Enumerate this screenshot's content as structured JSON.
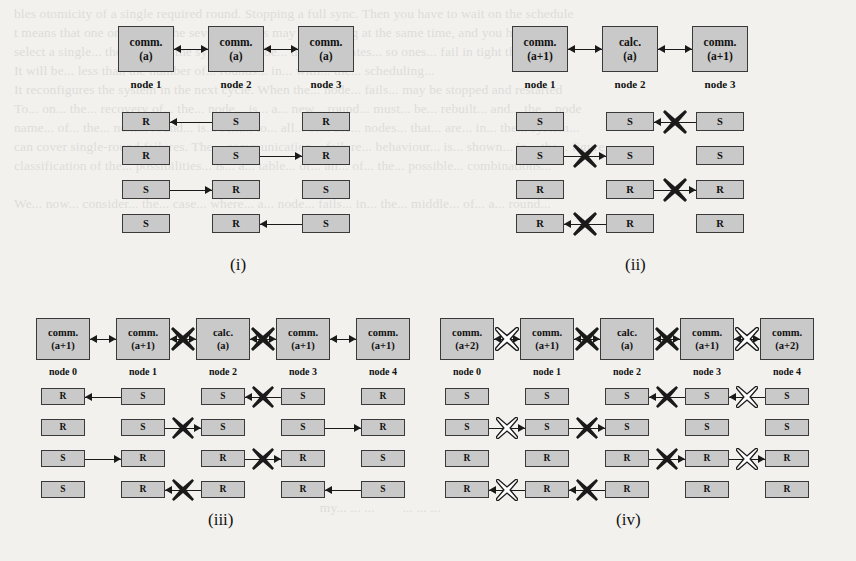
{
  "figure": {
    "background_color": "#f2f1ee",
    "box_fill_color": "#c9c9c9",
    "box_border_color": "#3a3a3a",
    "line_color": "#1a1a1a",
    "blocked_solid_color": "#1a1a1a",
    "blocked_hollow_fill": "#ffffff",
    "bleed_text": "bles otomicity of a single required round. Stopping a full sync. Then you have to wait on the schedule\nt means that one or more of the several rounds may be running at the same time, and you have to\nselect a single... the nodes in the system may be... the node states... so ones... fail in tight that\nIt will be... less than the number of... rounds... in... with... the... scheduling...\nIt reconfigures the system in the next cycle. When the... node... fails... may be stopped and restarted\nTo... on... the... recovery of... the... node... is... a... new... round... must... be... rebuilt... and... the... node\nname... of... the... next... round... is... sent... to... all... of... the... nodes... that... are... in... the... system...\ncan cover single-round failures. The... communication... failure... behaviour... is... shown... in... the... figure\nclassification of the... possibilities... is... a... table... of... all... of... the... possible... combinations...\n\nWe... now... consider... the... case... where... a... node... fails... in... the... middle... of... a... round...\n\n\n\n\n\n\n\n\n\n\n\n\n\n\n\n                                                                                        my... ... ...        ... ... ..."
  },
  "panels": [
    {
      "id": "i",
      "caption": "(i)",
      "nodes": [
        {
          "label": "node 1",
          "top_line1": "comm.",
          "top_line2": "(a)"
        },
        {
          "label": "node 2",
          "top_line1": "comm.",
          "top_line2": "(a)"
        },
        {
          "label": "node 3",
          "top_line1": "comm.",
          "top_line2": "(a)"
        }
      ],
      "top_connectors": [
        {
          "from": 0,
          "to": 1,
          "style": "double",
          "blocked": "none"
        },
        {
          "from": 1,
          "to": 2,
          "style": "double",
          "blocked": "none"
        }
      ],
      "rows": [
        {
          "cells": [
            "R",
            "S",
            "R"
          ],
          "arrows": [
            {
              "from": 1,
              "to": 0,
              "direction": "left",
              "blocked": "none"
            }
          ]
        },
        {
          "cells": [
            "R",
            "S",
            "R"
          ],
          "arrows": [
            {
              "from": 1,
              "to": 2,
              "direction": "right",
              "blocked": "none"
            }
          ]
        },
        {
          "cells": [
            "S",
            "R",
            "S"
          ],
          "arrows": [
            {
              "from": 0,
              "to": 1,
              "direction": "right",
              "blocked": "none"
            }
          ]
        },
        {
          "cells": [
            "S",
            "R",
            "S"
          ],
          "arrows": [
            {
              "from": 2,
              "to": 1,
              "direction": "left",
              "blocked": "none"
            }
          ]
        }
      ]
    },
    {
      "id": "ii",
      "caption": "(ii)",
      "nodes": [
        {
          "label": "node 1",
          "top_line1": "comm.",
          "top_line2": "(a+1)"
        },
        {
          "label": "node 2",
          "top_line1": "calc.",
          "top_line2": "(a)"
        },
        {
          "label": "node 3",
          "top_line1": "comm.",
          "top_line2": "(a+1)"
        }
      ],
      "top_connectors": [
        {
          "from": 0,
          "to": 1,
          "style": "double",
          "blocked": "none"
        },
        {
          "from": 1,
          "to": 2,
          "style": "double",
          "blocked": "none"
        }
      ],
      "rows": [
        {
          "cells": [
            "S",
            "S",
            "S"
          ],
          "arrows": [
            {
              "from": 2,
              "to": 1,
              "direction": "left",
              "blocked": "solid"
            }
          ]
        },
        {
          "cells": [
            "S",
            "S",
            "S"
          ],
          "arrows": [
            {
              "from": 0,
              "to": 1,
              "direction": "right",
              "blocked": "solid"
            }
          ]
        },
        {
          "cells": [
            "R",
            "R",
            "R"
          ],
          "arrows": [
            {
              "from": 1,
              "to": 2,
              "direction": "right",
              "blocked": "solid"
            }
          ]
        },
        {
          "cells": [
            "R",
            "R",
            "R"
          ],
          "arrows": [
            {
              "from": 1,
              "to": 0,
              "direction": "left",
              "blocked": "solid"
            }
          ]
        }
      ]
    },
    {
      "id": "iii",
      "caption": "(iii)",
      "nodes": [
        {
          "label": "node 0",
          "top_line1": "comm.",
          "top_line2": "(a+1)"
        },
        {
          "label": "node 1",
          "top_line1": "comm.",
          "top_line2": "(a+1)"
        },
        {
          "label": "node 2",
          "top_line1": "calc.",
          "top_line2": "(a)"
        },
        {
          "label": "node 3",
          "top_line1": "comm.",
          "top_line2": "(a+1)"
        },
        {
          "label": "node 4",
          "top_line1": "comm.",
          "top_line2": "(a+1)"
        }
      ],
      "top_connectors": [
        {
          "from": 0,
          "to": 1,
          "style": "double",
          "blocked": "none"
        },
        {
          "from": 1,
          "to": 2,
          "style": "double",
          "blocked": "solid"
        },
        {
          "from": 2,
          "to": 3,
          "style": "double",
          "blocked": "solid"
        },
        {
          "from": 3,
          "to": 4,
          "style": "double",
          "blocked": "none"
        }
      ],
      "rows": [
        {
          "cells": [
            "R",
            "S",
            "S",
            "S",
            "R"
          ],
          "arrows": [
            {
              "from": 1,
              "to": 0,
              "direction": "left",
              "blocked": "none"
            },
            {
              "from": 3,
              "to": 2,
              "direction": "left",
              "blocked": "solid"
            }
          ]
        },
        {
          "cells": [
            "R",
            "S",
            "S",
            "S",
            "R"
          ],
          "arrows": [
            {
              "from": 1,
              "to": 2,
              "direction": "right",
              "blocked": "solid"
            },
            {
              "from": 3,
              "to": 4,
              "direction": "right",
              "blocked": "none"
            }
          ]
        },
        {
          "cells": [
            "S",
            "R",
            "R",
            "R",
            "S"
          ],
          "arrows": [
            {
              "from": 0,
              "to": 1,
              "direction": "right",
              "blocked": "none"
            },
            {
              "from": 2,
              "to": 3,
              "direction": "right",
              "blocked": "solid"
            }
          ]
        },
        {
          "cells": [
            "S",
            "R",
            "R",
            "R",
            "S"
          ],
          "arrows": [
            {
              "from": 2,
              "to": 1,
              "direction": "left",
              "blocked": "solid"
            },
            {
              "from": 4,
              "to": 3,
              "direction": "left",
              "blocked": "none"
            }
          ]
        }
      ]
    },
    {
      "id": "iv",
      "caption": "(iv)",
      "nodes": [
        {
          "label": "node 0",
          "top_line1": "comm.",
          "top_line2": "(a+2)"
        },
        {
          "label": "node 1",
          "top_line1": "comm.",
          "top_line2": "(a+1)"
        },
        {
          "label": "node 2",
          "top_line1": "calc.",
          "top_line2": "(a)"
        },
        {
          "label": "node 3",
          "top_line1": "comm.",
          "top_line2": "(a+1)"
        },
        {
          "label": "node 4",
          "top_line1": "comm.",
          "top_line2": "(a+2)"
        }
      ],
      "top_connectors": [
        {
          "from": 0,
          "to": 1,
          "style": "double",
          "blocked": "hollow"
        },
        {
          "from": 1,
          "to": 2,
          "style": "double",
          "blocked": "solid"
        },
        {
          "from": 2,
          "to": 3,
          "style": "double",
          "blocked": "solid"
        },
        {
          "from": 3,
          "to": 4,
          "style": "double",
          "blocked": "hollow"
        }
      ],
      "rows": [
        {
          "cells": [
            "S",
            "S",
            "S",
            "S",
            "S"
          ],
          "arrows": [
            {
              "from": 3,
              "to": 2,
              "direction": "left",
              "blocked": "solid"
            },
            {
              "from": 4,
              "to": 3,
              "direction": "left",
              "blocked": "hollow"
            }
          ]
        },
        {
          "cells": [
            "S",
            "S",
            "S",
            "S",
            "S"
          ],
          "arrows": [
            {
              "from": 0,
              "to": 1,
              "direction": "right",
              "blocked": "hollow"
            },
            {
              "from": 1,
              "to": 2,
              "direction": "right",
              "blocked": "solid"
            }
          ]
        },
        {
          "cells": [
            "R",
            "R",
            "R",
            "R",
            "R"
          ],
          "arrows": [
            {
              "from": 2,
              "to": 3,
              "direction": "right",
              "blocked": "solid"
            },
            {
              "from": 3,
              "to": 4,
              "direction": "right",
              "blocked": "hollow"
            }
          ]
        },
        {
          "cells": [
            "R",
            "R",
            "R",
            "R",
            "R"
          ],
          "arrows": [
            {
              "from": 1,
              "to": 0,
              "direction": "left",
              "blocked": "hollow"
            },
            {
              "from": 2,
              "to": 1,
              "direction": "left",
              "blocked": "solid"
            }
          ]
        }
      ]
    }
  ]
}
